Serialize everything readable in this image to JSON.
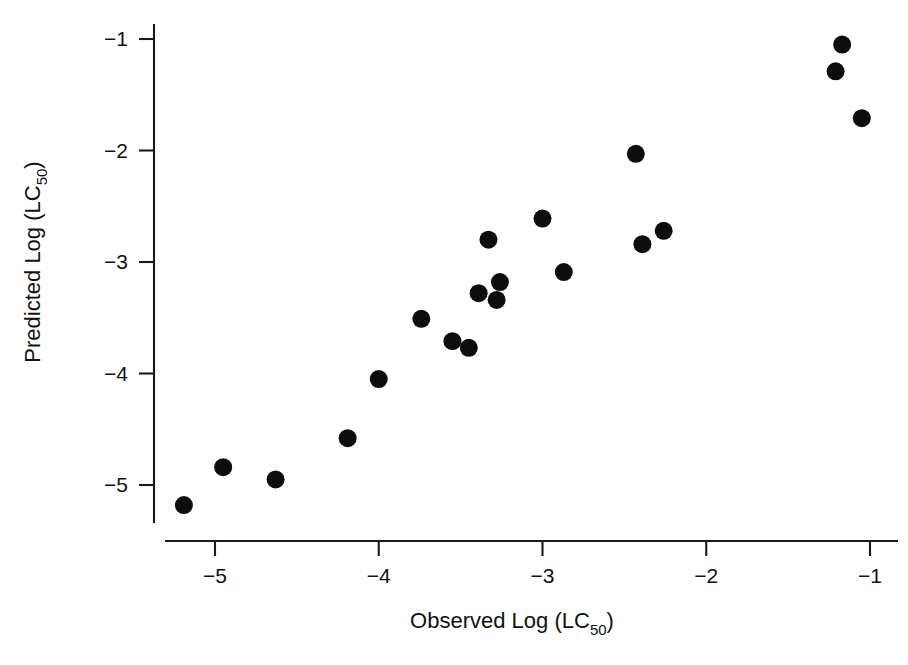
{
  "chart_data": {
    "type": "scatter",
    "title": "",
    "xlabel": "Observed Log (LC50)",
    "xlabel_main": "Observed Log (LC",
    "xlabel_sub": "50",
    "xlabel_tail": ")",
    "ylabel": "Predicted Log (LC50)",
    "ylabel_main": "Predicted Log (LC",
    "ylabel_sub": "50",
    "ylabel_tail": ")",
    "xlim": [
      -5.35,
      -0.85
    ],
    "ylim": [
      -5.4,
      -0.85
    ],
    "xticks": [
      -5,
      -4,
      -3,
      -2,
      -1
    ],
    "xtick_labels": [
      "−5",
      "−4",
      "−3",
      "−2",
      "−1"
    ],
    "yticks": [
      -1,
      -2,
      -3,
      -4,
      -5
    ],
    "ytick_labels": [
      "−1",
      "−2",
      "−3",
      "−4",
      "−5"
    ],
    "grid": false,
    "legend": "none",
    "marker": "filled-circle",
    "marker_color": "#0d0d0d",
    "marker_size_px": 9,
    "n_points": 21,
    "x": [
      -5.19,
      -4.95,
      -4.63,
      -4.19,
      -4.0,
      -3.74,
      -3.55,
      -3.45,
      -3.39,
      -3.33,
      -3.28,
      -3.26,
      -2.94,
      -3.0,
      -2.87,
      -2.39,
      -2.26,
      -2.43,
      -1.21,
      -1.17,
      -1.05
    ],
    "y": [
      -5.18,
      -4.84,
      -4.95,
      -4.58,
      -4.05,
      -3.51,
      -3.71,
      -3.77,
      -3.28,
      -2.8,
      -3.34,
      -3.18,
      -3.07,
      -2.61,
      -3.09,
      -2.84,
      -2.72,
      -2.03,
      -1.29,
      -1.05,
      -1.71
    ],
    "points": [
      {
        "x": -5.19,
        "y": -5.18
      },
      {
        "x": -4.95,
        "y": -4.84
      },
      {
        "x": -4.63,
        "y": -4.95
      },
      {
        "x": -4.19,
        "y": -4.58
      },
      {
        "x": -4.0,
        "y": -4.05
      },
      {
        "x": -3.74,
        "y": -3.51
      },
      {
        "x": -3.55,
        "y": -3.71
      },
      {
        "x": -3.45,
        "y": -3.77
      },
      {
        "x": -3.39,
        "y": -3.28
      },
      {
        "x": -3.33,
        "y": -2.8
      },
      {
        "x": -3.28,
        "y": -3.34
      },
      {
        "x": -3.26,
        "y": -3.18
      },
      {
        "x": -3.0,
        "y": -2.61
      },
      {
        "x": -2.87,
        "y": -3.09
      },
      {
        "x": -2.43,
        "y": -2.03
      },
      {
        "x": -2.39,
        "y": -2.84
      },
      {
        "x": -2.26,
        "y": -2.72
      },
      {
        "x": -1.21,
        "y": -1.29
      },
      {
        "x": -1.17,
        "y": -1.05
      },
      {
        "x": -1.05,
        "y": -1.71
      }
    ],
    "axis_color": "#1a1a1a",
    "background_color": "#ffffff"
  }
}
